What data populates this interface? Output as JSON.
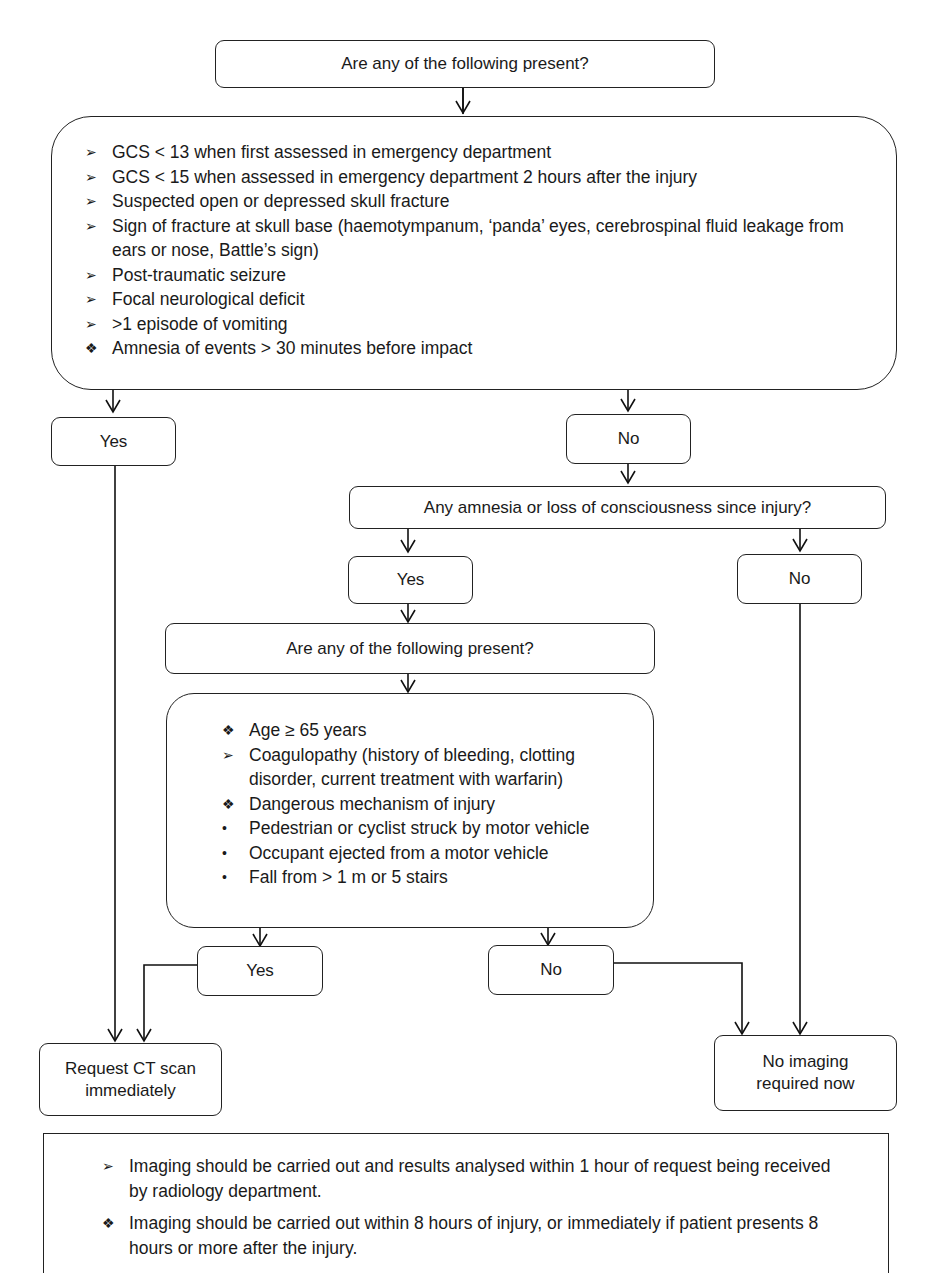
{
  "flowchart": {
    "top_question": "Are any of the following present?",
    "high_risk_criteria": [
      {
        "bullet": "arrowhead",
        "symbol": "➢",
        "text": "GCS < 13 when first assessed in emergency department"
      },
      {
        "bullet": "arrowhead",
        "symbol": "➢",
        "text": "GCS < 15 when assessed in emergency department 2 hours after the injury"
      },
      {
        "bullet": "arrowhead",
        "symbol": "➢",
        "text": "Suspected open or depressed skull fracture"
      },
      {
        "bullet": "arrowhead",
        "symbol": "➢",
        "text": "Sign of fracture at skull base (haemotympanum, ‘panda’ eyes, cerebrospinal fluid leakage from ears or nose, Battle’s sign)"
      },
      {
        "bullet": "arrowhead",
        "symbol": "➢",
        "text": "Post-traumatic seizure"
      },
      {
        "bullet": "arrowhead",
        "symbol": "➢",
        "text": "Focal neurological deficit"
      },
      {
        "bullet": "arrowhead",
        "symbol": "➢",
        "text": ">1 episode of vomiting"
      },
      {
        "bullet": "diamond",
        "symbol": "❖",
        "text": "Amnesia of events > 30 minutes before impact"
      }
    ],
    "branch1_yes": "Yes",
    "branch1_no": "No",
    "second_question": "Any amnesia or loss of consciousness since injury?",
    "branch2_yes": "Yes",
    "branch2_no": "No",
    "third_question": "Are any of the following present?",
    "medium_risk_criteria": [
      {
        "bullet": "diamond",
        "symbol": "❖",
        "text": "Age ≥ 65 years"
      },
      {
        "bullet": "arrowhead",
        "symbol": "➢",
        "text": "Coagulopathy (history of bleeding, clotting disorder, current treatment with warfarin)"
      },
      {
        "bullet": "diamond",
        "symbol": "❖",
        "text": "Dangerous mechanism of injury"
      },
      {
        "bullet": "dot",
        "symbol": "•",
        "text": "Pedestrian or cyclist struck by motor vehicle"
      },
      {
        "bullet": "dot",
        "symbol": "•",
        "text": "Occupant ejected from a motor vehicle"
      },
      {
        "bullet": "dot",
        "symbol": "•",
        "text": "Fall from > 1 m or 5 stairs"
      }
    ],
    "branch3_yes": "Yes",
    "branch3_no": "No",
    "outcome_ct": "Request CT scan immediately",
    "outcome_no_imaging": "No imaging required now"
  },
  "notes": [
    {
      "bullet": "arrowhead",
      "symbol": "➢",
      "text": "Imaging should be carried out and results analysed within 1 hour of request being received by radiology department."
    },
    {
      "bullet": "diamond",
      "symbol": "❖",
      "text": "Imaging should be carried out within 8 hours of injury, or immediately if patient presents 8 hours or more after the injury."
    }
  ]
}
